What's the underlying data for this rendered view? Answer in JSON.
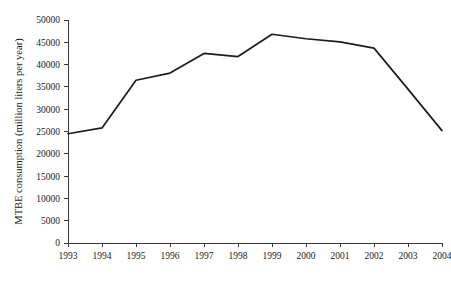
{
  "chart_data": {
    "type": "line",
    "title": "",
    "xlabel": "",
    "ylabel": "MTBE consumption (million liters per year)",
    "categories": [
      "1993",
      "1994",
      "1995",
      "1996",
      "1997",
      "1998",
      "1999",
      "2000",
      "2001",
      "2002",
      "2003",
      "2004"
    ],
    "x": [
      1993,
      1994,
      1995,
      1996,
      1997,
      1998,
      1999,
      2000,
      2001,
      2002,
      2003,
      2004
    ],
    "values": [
      24500,
      25800,
      36500,
      38100,
      42500,
      41800,
      46800,
      45800,
      45100,
      43700,
      34500,
      25200
    ],
    "series": [
      {
        "name": "MTBE consumption",
        "values": [
          24500,
          25800,
          36500,
          38100,
          42500,
          41800,
          46800,
          45800,
          45100,
          43700,
          34500,
          25200
        ],
        "color": "#1c1c1c"
      }
    ],
    "ylim": [
      0,
      50000
    ],
    "yticks": [
      0,
      5000,
      10000,
      15000,
      20000,
      25000,
      30000,
      35000,
      40000,
      45000,
      50000
    ],
    "ytick_labels": [
      "0",
      "5000",
      "10000",
      "15000",
      "20000",
      "25000",
      "30000",
      "35000",
      "40000",
      "45000",
      "50000"
    ],
    "xticks": [
      "1993",
      "1994",
      "1995",
      "1996",
      "1997",
      "1998",
      "1999",
      "2000",
      "2001",
      "2002",
      "2003",
      "2004"
    ],
    "grid": false,
    "legend": false,
    "legend_position": "none",
    "axis_color": "#3a3a3a",
    "background_color": "#ffffff",
    "tick_direction": "out"
  }
}
